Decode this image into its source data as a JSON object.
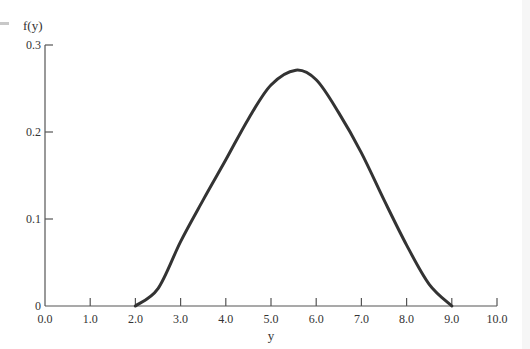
{
  "chart_data": {
    "type": "line",
    "title": "",
    "xlabel": "y",
    "ylabel": "f(y)",
    "xlim": [
      0.0,
      10.0
    ],
    "ylim": [
      0,
      0.3
    ],
    "grid": false,
    "legend": null,
    "x_ticks": [
      "0.0",
      "1.0",
      "2.0",
      "3.0",
      "4.0",
      "5.0",
      "6.0",
      "7.0",
      "8.0",
      "9.0",
      "10.0"
    ],
    "y_ticks": [
      "0",
      "0.1",
      "0.2",
      "0.3"
    ],
    "series": [
      {
        "name": "f(y)",
        "color": "#333333",
        "x": [
          2.0,
          2.5,
          3.0,
          3.5,
          4.0,
          4.5,
          5.0,
          5.55,
          6.0,
          6.5,
          7.0,
          7.5,
          8.0,
          8.5,
          9.0
        ],
        "values": [
          0.0,
          0.02,
          0.074,
          0.122,
          0.168,
          0.215,
          0.254,
          0.271,
          0.26,
          0.222,
          0.176,
          0.122,
          0.07,
          0.025,
          0.0
        ]
      }
    ]
  }
}
